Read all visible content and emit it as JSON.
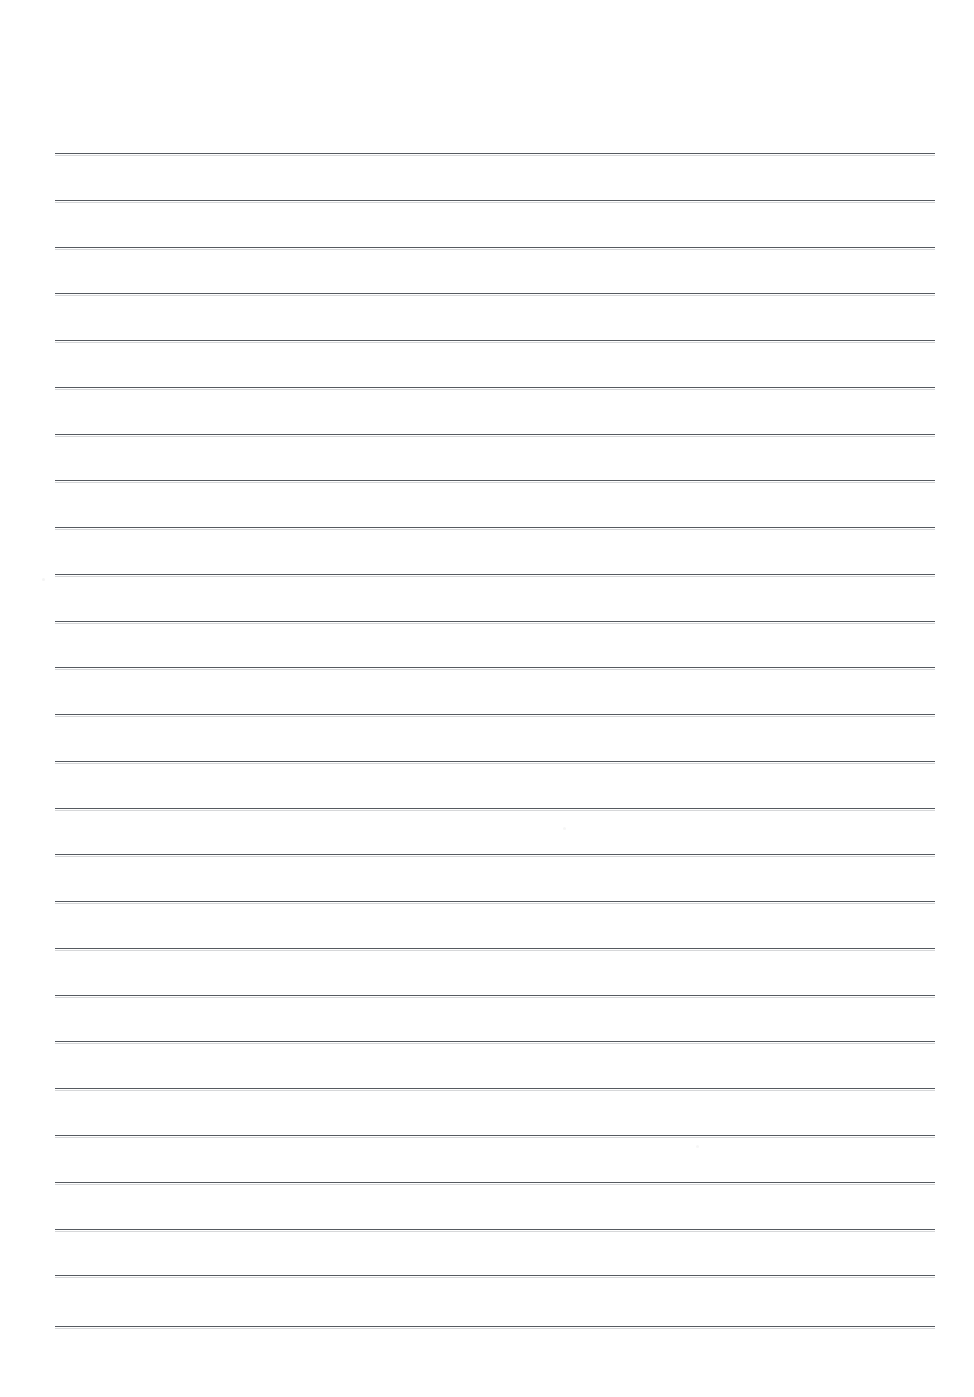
{
  "document": {
    "kind": "lined-paper-scan",
    "title": "Blank ruled notebook page",
    "page_width": 974,
    "page_height": 1397,
    "background_color": "#ffffff",
    "text_content": "",
    "written_text_present": false
  },
  "rules": {
    "count": 26,
    "color": "#565a60",
    "thickness_px": 1.2,
    "left_x": 55,
    "right_x": 935,
    "line_length": 880,
    "first_line_y": 153,
    "spacing_y": 46.9,
    "positions_y": [
      153,
      200,
      247,
      293,
      340,
      387,
      434,
      480,
      527,
      574,
      621,
      667,
      714,
      761,
      808,
      854,
      901,
      948,
      995,
      1041,
      1088,
      1135,
      1182,
      1229,
      1275,
      1326
    ]
  },
  "margins": {
    "top_px": 153,
    "bottom_px": 71,
    "left_px": 55,
    "right_px": 39
  },
  "artifacts": {
    "label": "scan specks",
    "items": [
      {
        "x": 42,
        "y": 578,
        "size": 3,
        "opacity": 0.3
      },
      {
        "x": 563,
        "y": 827,
        "size": 3,
        "opacity": 0.25
      },
      {
        "x": 696,
        "y": 1145,
        "size": 3,
        "opacity": 0.25
      }
    ]
  }
}
